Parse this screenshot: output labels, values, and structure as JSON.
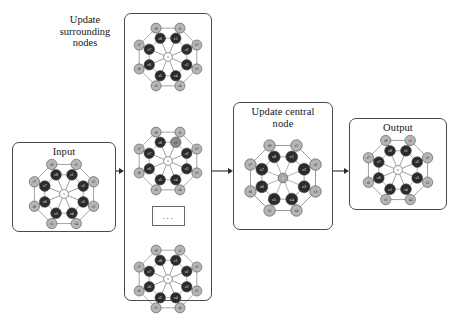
{
  "figure": {
    "type": "diagram",
    "caption": ""
  },
  "stages": [
    {
      "id": "input",
      "title": "Input",
      "title_position": "inside-top",
      "box": {
        "x": 12,
        "y": 142,
        "w": 104,
        "h": 90
      },
      "graph": {
        "center": {
          "label": "s",
          "fill": "white"
        },
        "inner_ring_fill": "dark",
        "outer_ring_fill": "light",
        "highlight": null
      }
    },
    {
      "id": "update-surrounding-nodes",
      "title": "Update\nsurrounding\nnodes",
      "title_position": "outside-left",
      "box": {
        "x": 124,
        "y": 13,
        "w": 88,
        "h": 288
      },
      "instances": [
        {
          "highlight": null
        },
        {
          "highlight": "c1"
        },
        {
          "highlight": null
        }
      ],
      "ellipsis": "..."
    },
    {
      "id": "update-central-node",
      "title": "Update central\nnode",
      "title_position": "inside-top",
      "box": {
        "x": 233,
        "y": 102,
        "w": 100,
        "h": 128
      },
      "graph": {
        "center": {
          "label": "s",
          "fill": "gray"
        },
        "inner_ring_fill": "dark",
        "outer_ring_fill": "light",
        "highlight": "s"
      }
    },
    {
      "id": "output",
      "title": "Output",
      "title_position": "inside-top",
      "box": {
        "x": 349,
        "y": 118,
        "w": 98,
        "h": 92
      },
      "graph": {
        "center": {
          "label": "s",
          "fill": "white"
        },
        "inner_ring_fill": "dark",
        "outer_ring_fill": "light",
        "highlight": null
      }
    }
  ],
  "node_labels": {
    "center": "s",
    "inner": [
      "c1",
      "c2",
      "c3",
      "c4",
      "c5",
      "c6",
      "c7",
      "c8"
    ],
    "outer": [
      "r1",
      "r2",
      "r3",
      "r4",
      "r5",
      "r6",
      "r7",
      "r8"
    ]
  },
  "colors": {
    "outline": "#4a4a4a",
    "inner_node": "#2b2b2b",
    "outer_node": "#b5b5b5",
    "center_node": "#ffffff",
    "center_node_highlight": "#a8a8a8",
    "inner_node_highlight": "#8a8a8a",
    "edge": "#6e6e6e",
    "spoke": "#9a9a9a",
    "text": "#141414",
    "background": "#ffffff"
  },
  "arrows": [
    {
      "id": "input-to-surrounding",
      "from": "input",
      "to": "update-surrounding-nodes",
      "x": 116,
      "y": 167,
      "length": 8
    },
    {
      "id": "surrounding-to-central",
      "from": "update-surrounding-nodes",
      "to": "update-central-node",
      "x": 212,
      "y": 167,
      "length": 21
    },
    {
      "id": "central-to-output",
      "from": "update-central-node",
      "to": "output",
      "x": 333,
      "y": 167,
      "length": 16
    }
  ]
}
